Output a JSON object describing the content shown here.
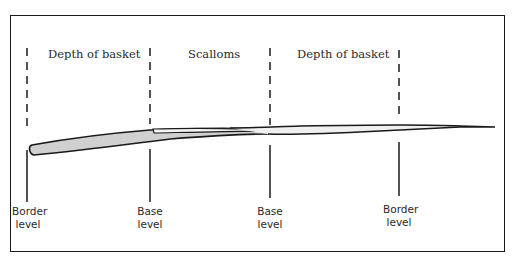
{
  "diagram": {
    "regions": [
      {
        "label": "Depth of basket"
      },
      {
        "label": "Scalloms"
      },
      {
        "label": "Depth of basket"
      }
    ],
    "levels": [
      {
        "line1": "Border",
        "line2": "level"
      },
      {
        "line1": "Base",
        "line2": "level"
      },
      {
        "line1": "Base",
        "line2": "level"
      },
      {
        "line1": "Border",
        "line2": "level"
      }
    ],
    "colors": {
      "stroke": "#1a1a1a",
      "fill": "#d0d0d0",
      "inner_fill": "#f2f2f2"
    }
  }
}
